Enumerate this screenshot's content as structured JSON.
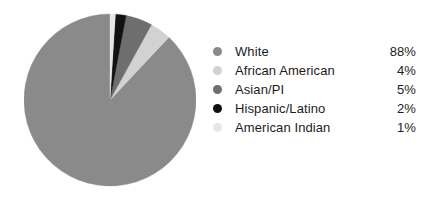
{
  "chart_data": {
    "type": "pie",
    "title": "",
    "subtitle": "",
    "xlabel": "",
    "ylabel": "",
    "grid": false,
    "legend_position": "right",
    "start_angle_deg": 0,
    "direction": "counterclockwise",
    "categories": [
      "White",
      "African American",
      "Asian/PI",
      "Hispanic/Latino",
      "American Indian"
    ],
    "values": [
      88,
      4,
      5,
      2,
      1
    ],
    "value_labels": [
      "88%",
      "4%",
      "5%",
      "2%",
      "1%"
    ],
    "unit": "%",
    "colors": [
      "#8a8a8a",
      "#d2d2d2",
      "#6e6e6e",
      "#111111",
      "#e6e6e6"
    ],
    "slices": [
      {
        "label": "White",
        "value": 88,
        "value_label": "88%",
        "color": "#8a8a8a"
      },
      {
        "label": "African American",
        "value": 4,
        "value_label": "4%",
        "color": "#d2d2d2"
      },
      {
        "label": "Asian/PI",
        "value": 5,
        "value_label": "5%",
        "color": "#6e6e6e"
      },
      {
        "label": "Hispanic/Latino",
        "value": 2,
        "value_label": "2%",
        "color": "#111111"
      },
      {
        "label": "American Indian",
        "value": 1,
        "value_label": "1%",
        "color": "#e6e6e6"
      }
    ]
  },
  "legend": {
    "rows": [
      {
        "label": "White",
        "value": "88%",
        "color": "#8a8a8a"
      },
      {
        "label": "African American",
        "value": "4%",
        "color": "#d2d2d2"
      },
      {
        "label": "Asian/PI",
        "value": "5%",
        "color": "#6e6e6e"
      },
      {
        "label": "Hispanic/Latino",
        "value": "2%",
        "color": "#111111"
      },
      {
        "label": "American Indian",
        "value": "1%",
        "color": "#e6e6e6"
      }
    ]
  }
}
